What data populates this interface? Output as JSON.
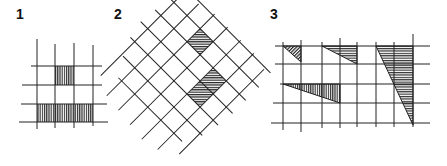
{
  "figure": {
    "panels": [
      {
        "id": "1",
        "label": "1",
        "description": "Square grid with one shaded cell and one shaded bottom row strip"
      },
      {
        "id": "2",
        "label": "2",
        "description": "45-degree rotated grid with one shaded diamond cell and a shaded diagonal strip of two cells"
      },
      {
        "id": "3",
        "label": "3",
        "description": "Square grid with four hatched right triangles of varying proportions"
      }
    ],
    "colors": {
      "line": "#222222",
      "hatch": "#333333",
      "background": "#ffffff"
    }
  }
}
